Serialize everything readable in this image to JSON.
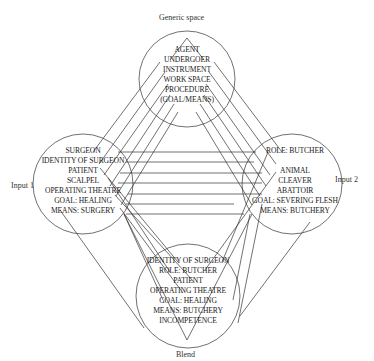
{
  "diagram": {
    "type": "conceptual-blending-network",
    "spaces": {
      "generic": {
        "label": "Generic space",
        "elements": [
          "AGENT",
          "UNDERGOER",
          "INSTRUMENT",
          "WORK SPACE",
          "PROCEDURE",
          "(GOAL/MEANS)"
        ]
      },
      "input1": {
        "label": "Input 1",
        "elements": [
          "SURGEON",
          "IDENTITY OF SURGEON",
          "PATIENT",
          "SCALPEL",
          "OPERATING THEATRE",
          "GOAL: HEALING",
          "MEANS: SURGERY"
        ]
      },
      "input2": {
        "label": "Input 2",
        "elements": [
          "ROLE: BUTCHER",
          "",
          "ANIMAL",
          "CLEAVER",
          "ABATTOIR",
          "GOAL: SEVERING FLESH",
          "MEANS: BUTCHERY"
        ]
      },
      "blend": {
        "label": "Blend",
        "elements": [
          "IDENTITY OF SURGEON",
          "ROLE: BUTCHER",
          "PATIENT",
          "OPERATING THEATRE",
          "GOAL: HEALING",
          "MEANS: BUTCHERY",
          "INCOMPETENCE"
        ]
      }
    },
    "colors": {
      "line": "#333333",
      "text": "#1a1a1a",
      "background": "#ffffff"
    }
  }
}
